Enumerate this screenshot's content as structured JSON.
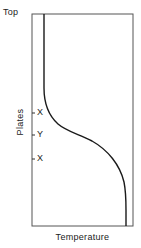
{
  "diagram": {
    "top_label": "Top",
    "x_axis_label": "Temperature",
    "y_axis_label": "Plates",
    "tick_labels": [
      "X",
      "Y",
      "X"
    ],
    "line_color": "#1a1a1a",
    "frame_color": "#555555"
  }
}
